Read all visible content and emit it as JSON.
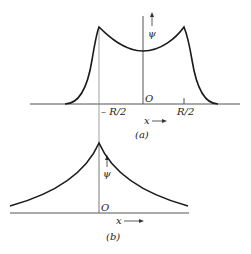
{
  "figure_a": {
    "caption": "(a)",
    "origin_label": "O",
    "y_axis_label": "ψ",
    "x_axis_label": "x",
    "tick_left": "– R/2",
    "tick_right": "R/2",
    "description": "Symmetric function with cusps at x = ±R/2 and a minimum at the origin, decaying to zero outside"
  },
  "figure_b": {
    "caption": "(b)",
    "origin_label": "O",
    "y_axis_label": "ψ",
    "x_axis_label": "x",
    "description": "Symmetric exponential decay with a cusp at the origin"
  },
  "colors": {
    "curve": "#1a1a1a",
    "axis": "#555555",
    "background": "#ffffff"
  }
}
